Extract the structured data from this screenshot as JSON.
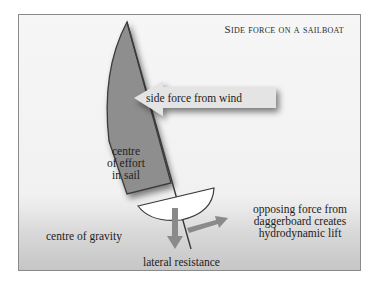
{
  "title": "Side force on a sailboat",
  "labels": {
    "side_force": "side force from wind",
    "effort_1": "centre",
    "effort_2": "of effort",
    "effort_3": "in sail",
    "gravity": "centre of gravity",
    "lateral": "lateral resistance",
    "lift_1": "opposing force from",
    "lift_2": "daggerboard creates",
    "lift_3": "hydrodynamic lift"
  },
  "colors": {
    "sail_fill": "#8e8e8e",
    "outline": "#3a3a3a",
    "arrow_light": "#e2e2e2",
    "arrow_dark": "#8a8a8a",
    "hull_fill": "#ffffff"
  }
}
